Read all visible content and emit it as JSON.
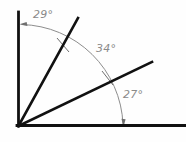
{
  "diagram": {
    "background_color": "#fefefe",
    "line_color": "#111111",
    "arc_color": "#8d8d8d",
    "label_color": "#8a8a8a",
    "vertex": {
      "x": 18,
      "y": 126
    },
    "rays": [
      {
        "name": "vertical-axis-ray",
        "angle_deg": 90,
        "end_x": 18,
        "end_y": 12
      },
      {
        "name": "steep-ray",
        "angle_deg": 61,
        "end_x": 78,
        "end_y": 18
      },
      {
        "name": "shallow-ray",
        "angle_deg": 27,
        "end_x": 152,
        "end_y": 62
      },
      {
        "name": "horizontal-axis-ray",
        "angle_deg": 0,
        "end_x": 186,
        "end_y": 126
      }
    ],
    "arc": {
      "radius": 106,
      "start_angle_deg": 90,
      "end_angle_deg": 0,
      "start_point": {
        "x": 20,
        "y": 24
      },
      "end_point": {
        "x": 124,
        "y": 126
      }
    },
    "angles": [
      {
        "id": "angle-29",
        "value": "29°",
        "degrees": 29,
        "between": "vertical-axis-ray and steep-ray",
        "label_x": 33,
        "label_y": 8
      },
      {
        "id": "angle-34",
        "value": "34°",
        "degrees": 34,
        "between": "steep-ray and shallow-ray",
        "label_x": 96,
        "label_y": 42
      },
      {
        "id": "angle-27",
        "value": "27°",
        "degrees": 27,
        "between": "shallow-ray and horizontal-axis-ray",
        "label_x": 123,
        "label_y": 88
      }
    ],
    "total_degrees": "90°"
  }
}
